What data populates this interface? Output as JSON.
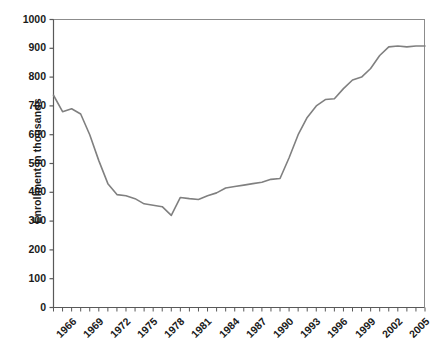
{
  "chart_data": {
    "type": "line",
    "title": "",
    "xlabel": "",
    "ylabel": "Enrollment in thousands",
    "ylim": [
      0,
      1000
    ],
    "xlim": [
      1965,
      2006
    ],
    "y_ticks": [
      0,
      100,
      200,
      300,
      400,
      500,
      600,
      700,
      800,
      900,
      1000
    ],
    "x_ticks_labeled": [
      1966,
      1969,
      1972,
      1975,
      1978,
      1981,
      1984,
      1987,
      1990,
      1993,
      1996,
      1999,
      2002,
      2005
    ],
    "x_minor_tick_interval": 1,
    "grid": false,
    "legend": null,
    "line_color": "#808080",
    "axis_color": "#595959",
    "x": [
      1965,
      1966,
      1967,
      1968,
      1969,
      1970,
      1971,
      1972,
      1973,
      1974,
      1975,
      1976,
      1977,
      1978,
      1979,
      1980,
      1981,
      1982,
      1983,
      1984,
      1985,
      1986,
      1987,
      1988,
      1989,
      1990,
      1991,
      1992,
      1993,
      1994,
      1995,
      1996,
      1997,
      1998,
      1999,
      2000,
      2001,
      2002,
      2003,
      2004,
      2005,
      2006
    ],
    "values": [
      737,
      680,
      690,
      672,
      600,
      510,
      430,
      392,
      388,
      378,
      360,
      355,
      350,
      320,
      382,
      378,
      375,
      388,
      398,
      415,
      420,
      425,
      430,
      435,
      445,
      448,
      520,
      600,
      660,
      700,
      722,
      725,
      760,
      790,
      800,
      830,
      875,
      905,
      908,
      905,
      908,
      908
    ],
    "series": [
      {
        "name": "Enrollment",
        "values": [
          737,
          680,
          690,
          672,
          600,
          510,
          430,
          392,
          388,
          378,
          360,
          355,
          350,
          320,
          382,
          378,
          375,
          388,
          398,
          415,
          420,
          425,
          430,
          435,
          445,
          448,
          520,
          600,
          660,
          700,
          722,
          725,
          760,
          790,
          800,
          830,
          875,
          905,
          908,
          905,
          908,
          908
        ]
      }
    ]
  }
}
